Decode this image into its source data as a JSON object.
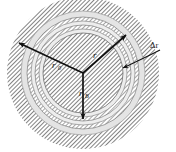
{
  "figure": {
    "type": "geometry-diagram",
    "background_color": "#ffffff",
    "center": {
      "x": 83,
      "y": 73
    },
    "rings": [
      {
        "name": "outer-hatched-annulus",
        "outer_radius": 76,
        "inner_radius": 62,
        "fill": "hatch",
        "hatch_color": "#555555"
      },
      {
        "name": "light-band-1",
        "outer_radius": 62,
        "inner_radius": 56,
        "fill": "#e2e2e2"
      },
      {
        "name": "hatched-band-1",
        "outer_radius": 56,
        "inner_radius": 52,
        "fill": "hatch",
        "hatch_color": "#666666"
      },
      {
        "name": "light-band-2",
        "outer_radius": 52,
        "inner_radius": 48,
        "fill": "#ededed"
      },
      {
        "name": "hatched-band-2",
        "outer_radius": 48,
        "inner_radius": 44,
        "fill": "hatch",
        "hatch_color": "#666666"
      },
      {
        "name": "light-band-3",
        "outer_radius": 44,
        "inner_radius": 40,
        "fill": "#ededed"
      },
      {
        "name": "inner-hatched-disk",
        "outer_radius": 40,
        "inner_radius": 0,
        "fill": "hatch",
        "hatch_color": "#555555"
      }
    ],
    "arrows": [
      {
        "name": "radius-arrow-r0",
        "label": "r",
        "subscript": "0",
        "angle_deg": 205,
        "length": 72,
        "label_x": 54,
        "label_y": 66
      },
      {
        "name": "radius-arrow-r",
        "label": "r",
        "subscript": "",
        "angle_deg": 325,
        "length": 55,
        "label_x": 94,
        "label_y": 56
      },
      {
        "name": "radius-arrow-rb",
        "label": "r",
        "subscript": "B",
        "angle_deg": 90,
        "length": 48,
        "label_x": 80,
        "label_y": 96
      }
    ],
    "callout": {
      "name": "delta-r-callout",
      "label": "Δr",
      "label_x": 152,
      "label_y": 50,
      "leader_from": {
        "x": 147,
        "y": 56
      },
      "leader_to": {
        "x": 126,
        "y": 68
      }
    },
    "labels": {
      "r0": "r",
      "r0_sub": "0",
      "r": "r",
      "rb": "r",
      "rb_sub": "B",
      "delta_r": "Δr"
    }
  }
}
